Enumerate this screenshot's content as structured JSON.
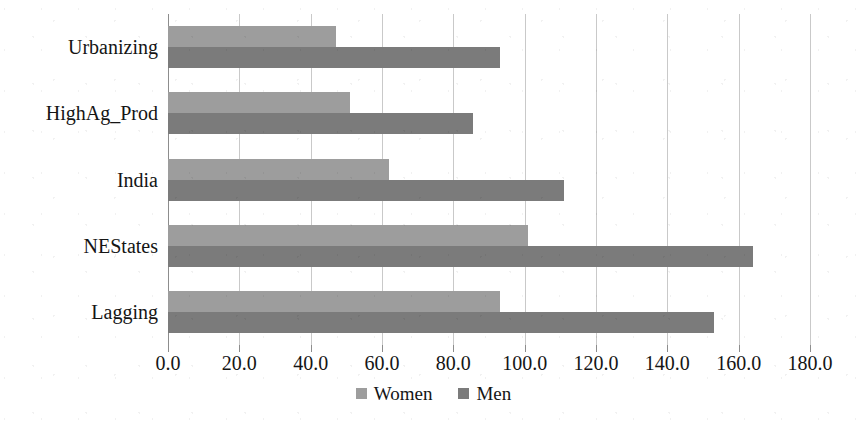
{
  "chart_data": {
    "type": "bar",
    "orientation": "horizontal",
    "title": "",
    "subtitle": "",
    "xlabel": "",
    "ylabel": "",
    "categories": [
      "Urbanizing",
      "HighAg_Prod",
      "India",
      "NEStates",
      "Lagging"
    ],
    "series": [
      {
        "name": "Women",
        "color": "#9d9d9d",
        "values": [
          47,
          51,
          62,
          101,
          93
        ]
      },
      {
        "name": "Men",
        "color": "#7b7b7b",
        "values": [
          93,
          85.5,
          111,
          164,
          153
        ]
      }
    ],
    "xlim": [
      0,
      180
    ],
    "xticks": [
      0,
      20,
      40,
      60,
      80,
      100,
      120,
      140,
      160,
      180
    ],
    "xtick_labels": [
      "0.0",
      "20.0",
      "40.0",
      "60.0",
      "80.0",
      "100.0",
      "120.0",
      "140.0",
      "160.0",
      "180.0"
    ],
    "grid": true,
    "grid_axis": "x",
    "grid_color": "#c9c9c9",
    "axis_color": "#8d8d8d",
    "legend_position": "bottom-center",
    "legend_entries": [
      "Women",
      "Men"
    ],
    "category_order_top_to_bottom": [
      "Urbanizing",
      "HighAg_Prod",
      "India",
      "NEStates",
      "Lagging"
    ],
    "background_color": "#ffffff"
  }
}
